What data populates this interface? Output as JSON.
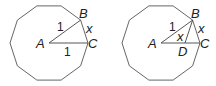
{
  "figures": [
    {
      "name": "left-decagon",
      "center": [
        49,
        43
      ],
      "radius": 39,
      "sides": 10,
      "rotation_deg": 0,
      "labels": {
        "A": "A",
        "B": "B",
        "C": "C",
        "x": "x",
        "AB": "1",
        "AC": "1"
      },
      "points": {
        "A": [
          49,
          43
        ],
        "B": [
          80.6,
          20.1
        ],
        "C": [
          88,
          43
        ]
      }
    },
    {
      "name": "right-decagon",
      "center": [
        161,
        43
      ],
      "radius": 39,
      "sides": 10,
      "rotation_deg": 0,
      "labels": {
        "A": "A",
        "B": "B",
        "C": "C",
        "D": "D",
        "x_side": "x",
        "x_inner": "x",
        "AB": "1"
      },
      "points": {
        "A": [
          161,
          43
        ],
        "B": [
          192.6,
          20.1
        ],
        "C": [
          200,
          43
        ],
        "D": [
          185,
          43
        ]
      }
    }
  ],
  "colors": {
    "stroke": "#555555",
    "text": "#222222",
    "background": "#ffffff"
  }
}
